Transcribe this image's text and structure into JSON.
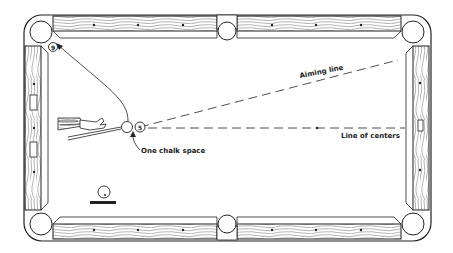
{
  "diagram": {
    "labels": {
      "aiming_line": "Aiming line",
      "line_of_centers": "Line of centers",
      "one_chalk_space": "One chalk space"
    },
    "balls": {
      "object_ball": "5",
      "target_ball": "9"
    },
    "colors": {
      "ink": "#222222",
      "background": "#ffffff",
      "rail_grain": "#555555"
    }
  }
}
